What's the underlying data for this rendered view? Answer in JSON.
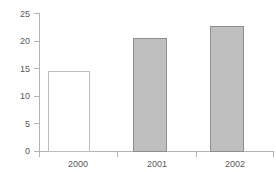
{
  "chart_data": {
    "type": "bar",
    "title": "",
    "subtitle": "",
    "xlabel": "",
    "ylabel": "",
    "categories": [
      "2000",
      "2001",
      "2002"
    ],
    "values": [
      14.6,
      20.6,
      22.8
    ],
    "series": [
      {
        "name": "",
        "values": [
          14.6,
          20.6,
          22.8
        ]
      }
    ],
    "ylim": [
      0,
      25
    ],
    "yticks": [
      0,
      5,
      10,
      15,
      20,
      25
    ],
    "ytick_labels": [
      "0",
      "5",
      "10",
      "15",
      "20",
      "25"
    ],
    "xtick_labels": [
      "2000",
      "2001",
      "2002"
    ],
    "grid": false,
    "legend": false,
    "legend_position": "none",
    "annotations": [],
    "bar_styles": [
      {
        "category": "2000",
        "fill": "#ffffff",
        "stroke": "#bdbdbf"
      },
      {
        "category": "2001",
        "fill": "#bfbfbf",
        "stroke": "#8f8f90"
      },
      {
        "category": "2002",
        "fill": "#bfbfbf",
        "stroke": "#8f8f90"
      }
    ]
  },
  "style": {
    "background": "#ffffff",
    "axis_color": "#b4b4b6",
    "tick_color": "#b4b4b6",
    "text_color": "#58585a",
    "bar_fill_gray": "#bfbfbf",
    "bar_fill_white": "#ffffff",
    "bar_stroke_gray": "#8f8f90",
    "bar_stroke_white": "#bdbdbf"
  }
}
